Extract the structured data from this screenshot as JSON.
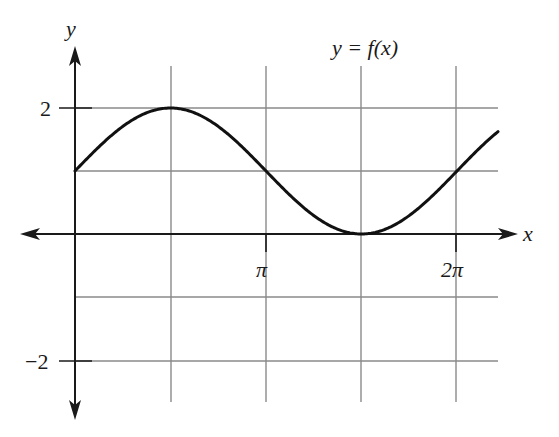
{
  "chart_data": {
    "type": "line",
    "title": "y = f(x)",
    "xlabel": "x",
    "ylabel": "y",
    "x_tick_labels": [
      "π",
      "2π"
    ],
    "y_tick_labels": [
      "2",
      "−2"
    ],
    "xlim": [
      -0.73,
      2.65
    ],
    "ylim": [
      -2.8,
      2.9
    ],
    "grid": true,
    "grid_x_step": "π/2",
    "grid_y_step": 1,
    "series": [
      {
        "name": "f(x) = 1 + sin(x)",
        "x": [
          0,
          0.785,
          1.571,
          2.356,
          3.142,
          3.927,
          4.712,
          5.498,
          6.283,
          7.069,
          7.643
        ],
        "values": [
          1,
          1.71,
          2,
          1.71,
          1,
          0.29,
          0,
          0.29,
          1,
          1.71,
          1.98
        ]
      }
    ],
    "annotations": [
      {
        "text": "y = f(x)",
        "position": "top-right"
      }
    ]
  },
  "labels": {
    "title": "y = f(x)",
    "x_axis": "x",
    "y_axis": "y",
    "tick_pi": "π",
    "tick_2pi": "2π",
    "tick_2": "2",
    "tick_neg2": "−2"
  },
  "colors": {
    "curve": "#111111",
    "axis": "#1a1a1a",
    "grid": "#8a8a8a",
    "background": "#ffffff"
  }
}
